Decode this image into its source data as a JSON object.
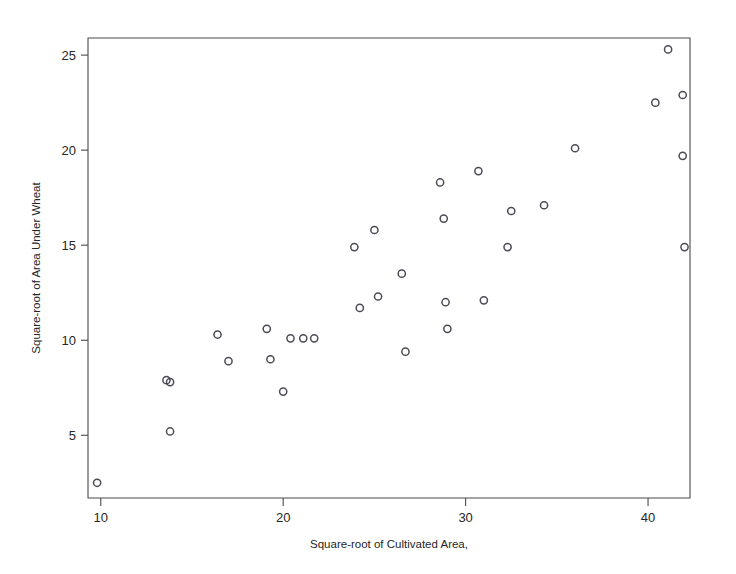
{
  "figure": {
    "background_color": "#ffffff",
    "frame_color": "#4a4a4a",
    "marker_color": "#4b4b56"
  },
  "chart_data": {
    "type": "scatter",
    "title": "",
    "xlabel": "Square-root of Cultivated Area,",
    "ylabel": "Square-root of Area Under Wheat",
    "xlim": [
      9.3,
      42.3
    ],
    "ylim": [
      1.7,
      25.9
    ],
    "xticks": [
      10,
      20,
      30,
      40
    ],
    "xtick_labels": [
      "10",
      "20",
      "30",
      "40"
    ],
    "yticks": [
      5,
      10,
      15,
      20,
      25
    ],
    "ytick_labels": [
      "5",
      "10",
      "15",
      "20",
      "25"
    ],
    "grid": false,
    "legend": false,
    "marker": "open-circle",
    "n_points": 33,
    "points": [
      {
        "x": 9.8,
        "y": 2.5
      },
      {
        "x": 13.6,
        "y": 7.9
      },
      {
        "x": 13.8,
        "y": 7.8
      },
      {
        "x": 13.8,
        "y": 5.2
      },
      {
        "x": 16.4,
        "y": 10.3
      },
      {
        "x": 17.0,
        "y": 8.9
      },
      {
        "x": 19.1,
        "y": 10.6
      },
      {
        "x": 19.3,
        "y": 9.0
      },
      {
        "x": 20.0,
        "y": 7.3
      },
      {
        "x": 20.4,
        "y": 10.1
      },
      {
        "x": 21.1,
        "y": 10.1
      },
      {
        "x": 21.7,
        "y": 10.1
      },
      {
        "x": 23.9,
        "y": 14.9
      },
      {
        "x": 24.2,
        "y": 11.7
      },
      {
        "x": 25.0,
        "y": 15.8
      },
      {
        "x": 25.2,
        "y": 12.3
      },
      {
        "x": 26.5,
        "y": 13.5
      },
      {
        "x": 26.7,
        "y": 9.4
      },
      {
        "x": 28.6,
        "y": 18.3
      },
      {
        "x": 28.8,
        "y": 16.4
      },
      {
        "x": 28.9,
        "y": 12.0
      },
      {
        "x": 29.0,
        "y": 10.6
      },
      {
        "x": 30.7,
        "y": 18.9
      },
      {
        "x": 31.0,
        "y": 12.1
      },
      {
        "x": 32.3,
        "y": 14.9
      },
      {
        "x": 32.5,
        "y": 16.8
      },
      {
        "x": 34.3,
        "y": 17.1
      },
      {
        "x": 36.0,
        "y": 20.1
      },
      {
        "x": 40.4,
        "y": 22.5
      },
      {
        "x": 41.1,
        "y": 25.3
      },
      {
        "x": 41.9,
        "y": 22.9
      },
      {
        "x": 41.9,
        "y": 19.7
      },
      {
        "x": 42.0,
        "y": 14.9
      }
    ]
  }
}
